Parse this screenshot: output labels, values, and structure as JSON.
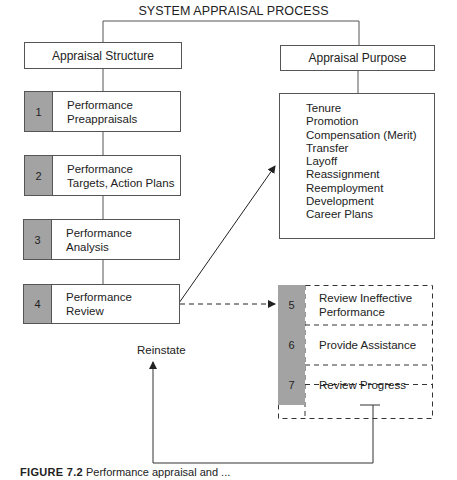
{
  "title": "SYSTEM APPRAISAL PROCESS",
  "left_column": {
    "header": "Appraisal Structure",
    "steps": [
      {
        "number": "1",
        "label": "Performance\nPreappraisals"
      },
      {
        "number": "2",
        "label": "Performance\nTargets, Action Plans"
      },
      {
        "number": "3",
        "label": "Performance\nAnalysis"
      },
      {
        "number": "4",
        "label": "Performance\nReview"
      }
    ]
  },
  "right_column": {
    "header": "Appraisal Purpose",
    "purposes": [
      "Tenure",
      "Promotion",
      "Compensation (Merit)",
      "Transfer",
      "Layoff",
      "Reassignment",
      "Reemployment",
      "Development",
      "Career Plans"
    ]
  },
  "ineffective_path": {
    "steps": [
      {
        "number": "5",
        "label": "Review Ineffective\nPerformance"
      },
      {
        "number": "6",
        "label": "Provide Assistance"
      },
      {
        "number": "7",
        "label": "Review Progress"
      },
      {
        "number": "8",
        "label": "Terminate or"
      }
    ],
    "loop_label": "Reinstate"
  },
  "caption": {
    "figure": "FIGURE 7.2",
    "text": "Performance appraisal and ..."
  },
  "colors": {
    "number_cell": "#a3a3a3",
    "line": "#555555"
  }
}
